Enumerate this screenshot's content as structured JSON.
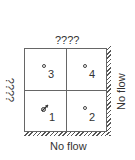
{
  "diagram": {
    "top_label": "????",
    "left_label": "????",
    "right_label": "No flow",
    "bottom_label": "No flow",
    "cells": [
      {
        "id": "3",
        "label": "3",
        "marker": "open-circle"
      },
      {
        "id": "4",
        "label": "4",
        "marker": "open-circle"
      },
      {
        "id": "1",
        "label": "1",
        "marker": "pumping-well-arrow"
      },
      {
        "id": "2",
        "label": "2",
        "marker": "open-circle"
      }
    ],
    "boundaries": {
      "right": "no-flow (hatched)",
      "bottom": "no-flow (hatched)"
    }
  }
}
